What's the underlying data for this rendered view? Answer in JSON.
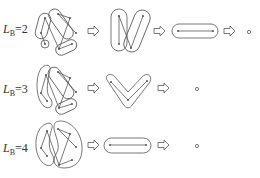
{
  "figure": {
    "rows": [
      {
        "label": {
          "var": "L",
          "sub": "B",
          "value": "=2"
        },
        "stages": [
          "graph-with-4-clusters",
          "two-clusters",
          "single-edge-cluster",
          "single-node"
        ]
      },
      {
        "label": {
          "var": "L",
          "sub": "B",
          "value": "=3"
        },
        "stages": [
          "graph-with-3-clusters",
          "v-shaped-cluster",
          "single-node"
        ]
      },
      {
        "label": {
          "var": "L",
          "sub": "B",
          "value": "=4"
        },
        "stages": [
          "graph-with-2-clusters",
          "single-edge-cluster",
          "single-node"
        ]
      }
    ],
    "arrow_glyph": "hollow-right-arrow",
    "colors": {
      "stroke": "#555555",
      "node": "#555555",
      "background": "#ffffff"
    }
  }
}
